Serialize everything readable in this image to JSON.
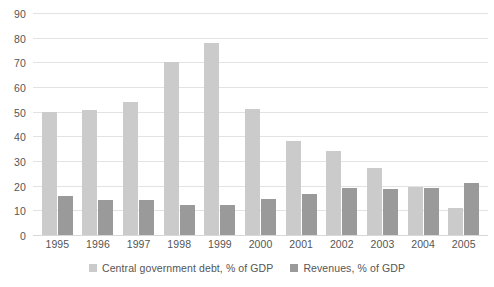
{
  "chart_data": {
    "type": "bar",
    "title": "",
    "subtitle": "",
    "xlabel": "",
    "ylabel": "",
    "ylim": [
      0,
      90
    ],
    "ytick_step": 10,
    "yticks": [
      0,
      10,
      20,
      30,
      40,
      50,
      60,
      70,
      80,
      90
    ],
    "grid": true,
    "grid_axis": "y",
    "legend_position": "bottom-center",
    "orientation": "vertical",
    "grouping": "clustered",
    "categories": [
      "1995",
      "1996",
      "1997",
      "1998",
      "1999",
      "2000",
      "2001",
      "2002",
      "2003",
      "2004",
      "2005"
    ],
    "series": [
      {
        "name": "Central government debt, % of GDP",
        "color": "#cbcbcb",
        "values": [
          50,
          50.5,
          54,
          70,
          78,
          51,
          38,
          34,
          27,
          19.5,
          11
        ]
      },
      {
        "name": "Revenues, % of GDP",
        "color": "#9a9a9a",
        "values": [
          16,
          14,
          14,
          12,
          12,
          14.5,
          16.5,
          19,
          18.5,
          19,
          21
        ]
      }
    ]
  },
  "colors": {
    "series_debt": "#cbcbcb",
    "series_revenues": "#9a9a9a",
    "gridline": "#e3e3e3",
    "text": "#555555",
    "background": "#ffffff"
  }
}
